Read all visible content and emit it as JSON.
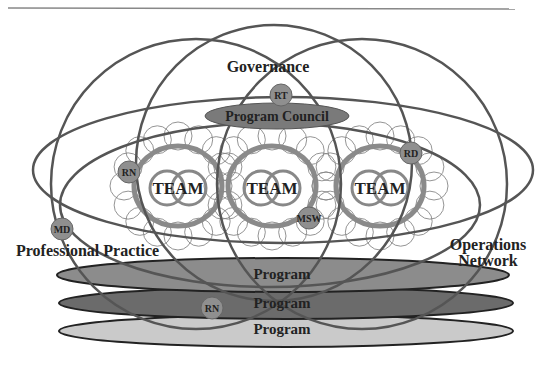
{
  "diagram": {
    "labels": {
      "governance": "Governance",
      "program_council": "Program Council",
      "professional_practice": "Professional Practice",
      "operations_1": "Operations",
      "operations_2": "Network"
    },
    "teams": [
      {
        "label": "TEAM",
        "cx": 178,
        "cy": 186
      },
      {
        "label": "TEAM",
        "cx": 272,
        "cy": 186
      },
      {
        "label": "TEAM",
        "cx": 380,
        "cy": 186
      }
    ],
    "programs": [
      {
        "label": "Program",
        "fill": "#8c8c8c"
      },
      {
        "label": "Program",
        "fill": "#6b6b6b"
      },
      {
        "label": "Program",
        "fill": "#cacaca"
      }
    ],
    "badges": [
      {
        "label": "RT",
        "cx": 281,
        "cy": 95
      },
      {
        "label": "RN",
        "cx": 129,
        "cy": 172
      },
      {
        "label": "RD",
        "cx": 411,
        "cy": 153
      },
      {
        "label": "MSW",
        "cx": 309,
        "cy": 218
      },
      {
        "label": "MD",
        "cx": 62,
        "cy": 229
      },
      {
        "label": "RN",
        "cx": 212,
        "cy": 308
      }
    ],
    "colors": {
      "line": "#555555",
      "ring": "#8a8a8a",
      "badge_fill": "#8f8f8f",
      "council_fill": "#7a7a7a"
    }
  }
}
